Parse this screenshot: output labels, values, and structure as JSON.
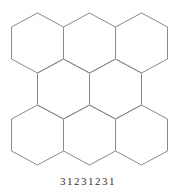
{
  "diagram": {
    "type": "hexagonal-grid",
    "rows": 3,
    "columns": 3,
    "stroke_color": "#8a8a8a",
    "background": "#ffffff",
    "hexagons": [
      {
        "row": 0,
        "col": 0,
        "cx": 37.5,
        "cy": 43
      },
      {
        "row": 0,
        "col": 1,
        "cx": 89.5,
        "cy": 43
      },
      {
        "row": 0,
        "col": 2,
        "cx": 141.5,
        "cy": 43
      },
      {
        "row": 1,
        "col": 0,
        "cx": 63.5,
        "cy": 89
      },
      {
        "row": 1,
        "col": 1,
        "cx": 115.5,
        "cy": 89
      },
      {
        "row": 2,
        "col": 0,
        "cx": 37.5,
        "cy": 135
      },
      {
        "row": 2,
        "col": 1,
        "cx": 89.5,
        "cy": 135
      },
      {
        "row": 2,
        "col": 2,
        "cx": 141.5,
        "cy": 135
      }
    ]
  },
  "caption": "31231231"
}
